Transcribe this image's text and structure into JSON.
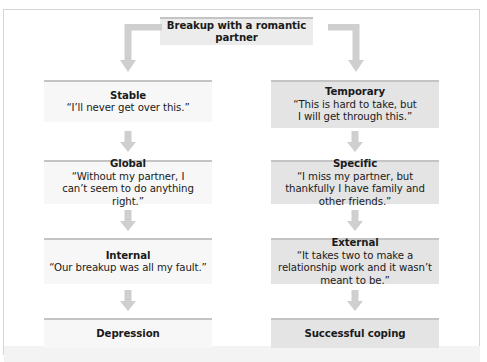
{
  "diagram": {
    "root": {
      "label": "Breakup with a romantic partner"
    },
    "left_column": [
      {
        "title": "Stable",
        "quote": "“I’ll never get over this.”"
      },
      {
        "title": "Global",
        "quote": "“Without my partner, I can’t seem to do anything right.”"
      },
      {
        "title": "Internal",
        "quote": "“Our breakup was all my fault.”"
      }
    ],
    "left_outcome": {
      "label": "Depression"
    },
    "right_column": [
      {
        "title": "Temporary",
        "quote": "“This is hard to take, but I will get through this.”"
      },
      {
        "title": "Specific",
        "quote": "“I miss my partner, but thankfully I have family and other friends.”"
      },
      {
        "title": "External",
        "quote": "“It takes two to make a relationship work and it wasn’t meant to be.”"
      }
    ],
    "right_outcome": {
      "label": "Successful coping"
    },
    "colors": {
      "left_box": "#f7f7f7",
      "right_box": "#e4e4e4",
      "top_box": "#ececec",
      "arrow": "#c8c8c8",
      "rule": "#c4c4c4"
    }
  }
}
